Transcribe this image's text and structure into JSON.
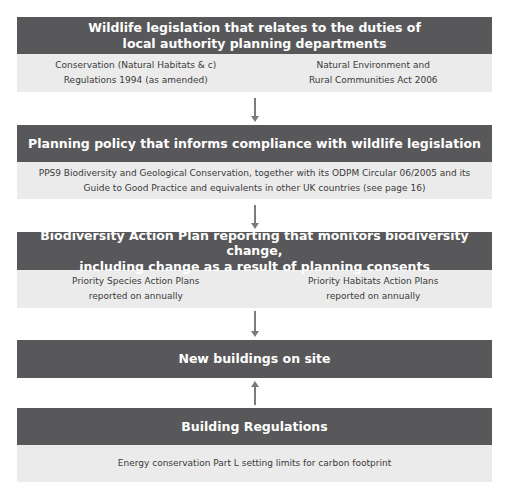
{
  "boxes": [
    {
      "title": "Wildlife legislation that relates to the duties of local authority planning departments",
      "title_lines": [
        "Wildlife legislation that relates to the duties of",
        "local authority planning departments"
      ],
      "items": [
        {
          "line1": "Conservation (Natural Habitats & c)",
          "line2": "Regulations 1994 (as amended)"
        },
        {
          "line1": "Natural Environment and",
          "line2": "Rural Communities Act 2006"
        }
      ]
    },
    {
      "title": "Planning policy that informs compliance with wildlife legislation",
      "text_lines": [
        "PPS9 Biodiversity and Geological Conservation, together with its ODPM Circular 06/2005 and its",
        "Guide to Good Practice and equivalents in other UK countries (see page 16)"
      ]
    },
    {
      "title": "Biodiversity Action Plan reporting that monitors biodiversity change, including change as a result of planning consents",
      "title_lines": [
        "Biodiversity Action Plan reporting that monitors biodiversity change,",
        "including change as a result of planning consents"
      ],
      "items": [
        {
          "line1": "Priority Species Action Plans",
          "line2": "reported on annually"
        },
        {
          "line1": "Priority Habitats Action Plans",
          "line2": "reported on annually"
        }
      ]
    },
    {
      "title": "New buildings on site"
    },
    {
      "title": "Building Regulations",
      "text_lines": [
        "Energy conservation Part L setting limits for carbon footprint"
      ]
    }
  ],
  "arrows": [
    {
      "from": "Wildlife legislation",
      "to": "Planning policy",
      "direction": "down"
    },
    {
      "from": "Planning policy",
      "to": "Biodiversity Action Plan reporting",
      "direction": "down"
    },
    {
      "from": "Biodiversity Action Plan reporting",
      "to": "New buildings on site",
      "direction": "down"
    },
    {
      "from": "Building Regulations",
      "to": "New buildings on site",
      "direction": "up"
    }
  ],
  "colors": {
    "header_bg": "#58585a",
    "body_bg": "#ebebeb",
    "arrow": "#7b7b7b"
  }
}
